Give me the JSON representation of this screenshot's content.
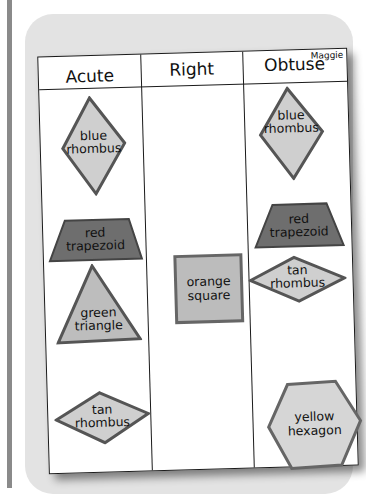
{
  "sheet": {
    "name": "Maggie",
    "columns": [
      {
        "title": "Acute"
      },
      {
        "title": "Right"
      },
      {
        "title": "Obtuse"
      }
    ]
  },
  "shapes": {
    "acute": [
      {
        "line1": "blue",
        "line2": "rhombus"
      },
      {
        "line1": "red",
        "line2": "trapezoid"
      },
      {
        "line1": "green",
        "line2": "triangle"
      },
      {
        "line1": "tan",
        "line2": "rhombus"
      }
    ],
    "right": [
      {
        "line1": "orange",
        "line2": "square"
      }
    ],
    "obtuse": [
      {
        "line1": "blue",
        "line2": "rhombus"
      },
      {
        "line1": "red",
        "line2": "trapezoid"
      },
      {
        "line1": "tan",
        "line2": "rhombus"
      },
      {
        "line1": "yellow",
        "line2": "hexagon"
      }
    ]
  },
  "colors": {
    "light_fill": "#cfcfcf",
    "dark_fill": "#6e6e6e",
    "edge": "#4a4a4a"
  }
}
